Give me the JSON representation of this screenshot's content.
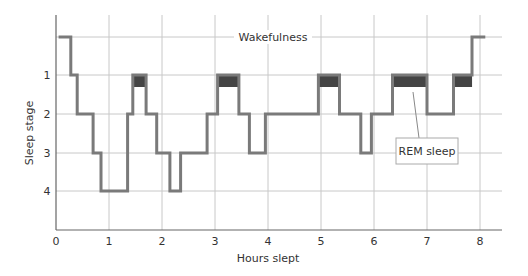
{
  "chart_data": {
    "type": "line",
    "subtype": "step",
    "title": "",
    "xlabel": "Hours slept",
    "ylabel": "Sleep stage",
    "xlim": [
      0,
      8.4
    ],
    "x_ticks": [
      "0",
      "1",
      "2",
      "3",
      "4",
      "5",
      "6",
      "7",
      "8"
    ],
    "y_ticks": [
      "1",
      "2",
      "3",
      "4"
    ],
    "y_levels": [
      "Wakefulness",
      "1",
      "2",
      "3",
      "4"
    ],
    "grid": true,
    "annotations": [
      {
        "text": "Wakefulness",
        "type": "line-label",
        "level": "Wake"
      },
      {
        "text": "REM sleep",
        "type": "callout",
        "points_to_x": 6.7
      }
    ],
    "series": [
      {
        "name": "Sleep stage",
        "segments": [
          {
            "start": 0.05,
            "end": 0.28,
            "stage": "W"
          },
          {
            "start": 0.28,
            "end": 0.4,
            "stage": 1
          },
          {
            "start": 0.4,
            "end": 0.7,
            "stage": 2
          },
          {
            "start": 0.7,
            "end": 0.85,
            "stage": 3
          },
          {
            "start": 0.85,
            "end": 1.35,
            "stage": 4
          },
          {
            "start": 1.35,
            "end": 1.45,
            "stage": 2
          },
          {
            "start": 1.45,
            "end": 1.7,
            "stage": 1,
            "rem": true
          },
          {
            "start": 1.7,
            "end": 1.9,
            "stage": 2
          },
          {
            "start": 1.9,
            "end": 2.15,
            "stage": 3
          },
          {
            "start": 2.15,
            "end": 2.35,
            "stage": 4
          },
          {
            "start": 2.35,
            "end": 2.85,
            "stage": 3
          },
          {
            "start": 2.85,
            "end": 3.05,
            "stage": 2
          },
          {
            "start": 3.05,
            "end": 3.45,
            "stage": 1,
            "rem": true
          },
          {
            "start": 3.45,
            "end": 3.65,
            "stage": 2
          },
          {
            "start": 3.65,
            "end": 3.95,
            "stage": 3
          },
          {
            "start": 3.95,
            "end": 4.95,
            "stage": 2
          },
          {
            "start": 4.95,
            "end": 5.35,
            "stage": 1,
            "rem": true
          },
          {
            "start": 5.35,
            "end": 5.75,
            "stage": 2
          },
          {
            "start": 5.75,
            "end": 5.95,
            "stage": 3
          },
          {
            "start": 5.95,
            "end": 6.35,
            "stage": 2
          },
          {
            "start": 6.35,
            "end": 7.0,
            "stage": 1,
            "rem": true
          },
          {
            "start": 7.0,
            "end": 7.5,
            "stage": 2
          },
          {
            "start": 7.5,
            "end": 7.85,
            "stage": 1,
            "rem": true
          },
          {
            "start": 7.85,
            "end": 8.1,
            "stage": "W"
          }
        ]
      }
    ],
    "colors": {
      "line": "#7a7a7a",
      "rem": "#444444",
      "grid": "#c8c8c8",
      "axis": "#666666"
    }
  }
}
